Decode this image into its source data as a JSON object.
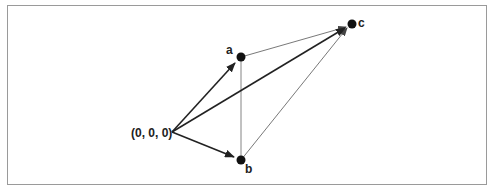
{
  "diagram": {
    "origin": {
      "label": "(0, 0, 0)",
      "x": 172,
      "y": 132
    },
    "points": [
      {
        "id": "a",
        "label": "a",
        "x": 241,
        "y": 57
      },
      {
        "id": "b",
        "label": "b",
        "x": 241,
        "y": 160
      },
      {
        "id": "c",
        "label": "c",
        "x": 352,
        "y": 24
      }
    ],
    "vectors": [
      {
        "from": "origin",
        "to": "a",
        "style": "bold-arrow"
      },
      {
        "from": "origin",
        "to": "b",
        "style": "bold-arrow"
      },
      {
        "from": "origin",
        "to": "c",
        "style": "bold-arrow"
      },
      {
        "from": "a",
        "to": "c",
        "style": "thin-arrow"
      },
      {
        "from": "b",
        "to": "c",
        "style": "thin-arrow"
      },
      {
        "from": "a",
        "to": "b",
        "style": "thin-line"
      }
    ],
    "colors": {
      "line": "#222222",
      "thin": "#555555",
      "border": "#9a9a9a"
    }
  }
}
